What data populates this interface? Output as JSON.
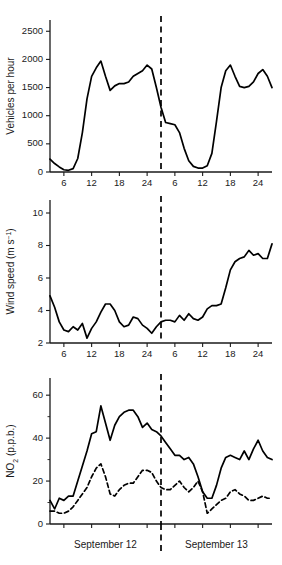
{
  "figure": {
    "day_labels": [
      "September 12",
      "September 13"
    ]
  },
  "chart_data": [
    {
      "type": "line",
      "panel": "traffic",
      "title": "",
      "xlabel": "",
      "ylabel": "Vehicles per hour",
      "ylim": [
        0,
        2700
      ],
      "yticks": [
        0,
        500,
        1000,
        1500,
        2000,
        2500
      ],
      "xlim": [
        3,
        51
      ],
      "xticks": [
        6,
        12,
        18,
        24,
        30,
        36,
        42,
        48
      ],
      "xticklabels": [
        "6",
        "12",
        "18",
        "24",
        "6",
        "12",
        "18",
        "24"
      ],
      "grid": false,
      "legend": "none",
      "annotations": [
        "dashed vertical divider at hour 27 (midnight between days)"
      ],
      "series": [
        {
          "name": "Vehicles per hour",
          "style": "solid",
          "x": [
            3,
            4,
            5,
            6,
            7,
            8,
            9,
            10,
            11,
            12,
            13,
            14,
            15,
            16,
            17,
            18,
            19,
            20,
            21,
            22,
            23,
            24,
            25,
            26,
            27,
            28,
            29,
            30,
            31,
            32,
            33,
            34,
            35,
            36,
            37,
            38,
            39,
            40,
            41,
            42,
            43,
            44,
            45,
            46,
            47,
            48,
            49,
            50,
            51
          ],
          "values": [
            230,
            150,
            90,
            40,
            30,
            60,
            240,
            700,
            1300,
            1700,
            1850,
            1970,
            1700,
            1450,
            1530,
            1570,
            1570,
            1600,
            1700,
            1750,
            1800,
            1900,
            1830,
            1500,
            1150,
            880,
            860,
            840,
            700,
            420,
            200,
            100,
            70,
            70,
            110,
            330,
            900,
            1500,
            1800,
            1900,
            1700,
            1520,
            1500,
            1520,
            1600,
            1750,
            1820,
            1700,
            1500,
            1250,
            1000,
            900,
            870,
            760
          ]
        }
      ]
    },
    {
      "type": "line",
      "panel": "wind",
      "title": "",
      "xlabel": "",
      "ylabel": "Wind speed (m s-1)",
      "ylim": [
        2,
        10.8
      ],
      "yticks": [
        2,
        4,
        6,
        8,
        10
      ],
      "xlim": [
        3,
        51
      ],
      "xticks": [
        6,
        12,
        18,
        24,
        30,
        36,
        42,
        48
      ],
      "xticklabels": [
        "6",
        "12",
        "18",
        "24",
        "6",
        "12",
        "18",
        "24"
      ],
      "grid": false,
      "legend": "none",
      "annotations": [
        "dashed vertical divider at hour 27 (midnight between days)"
      ],
      "series": [
        {
          "name": "Wind speed",
          "style": "solid",
          "x": [
            3,
            4,
            5,
            6,
            7,
            8,
            9,
            10,
            11,
            12,
            13,
            14,
            15,
            16,
            17,
            18,
            19,
            20,
            21,
            22,
            23,
            24,
            25,
            26,
            27,
            28,
            29,
            30,
            31,
            32,
            33,
            34,
            35,
            36,
            37,
            38,
            39,
            40,
            41,
            42,
            43,
            44,
            45,
            46,
            47,
            48,
            49,
            50,
            51
          ],
          "values": [
            4.9,
            4.2,
            3.3,
            2.8,
            2.7,
            3.0,
            2.8,
            3.2,
            2.3,
            2.9,
            3.3,
            3.9,
            4.4,
            4.4,
            4.0,
            3.3,
            3.0,
            3.1,
            3.6,
            3.5,
            3.1,
            2.9,
            2.6,
            3.0,
            3.3,
            3.4,
            3.4,
            3.3,
            3.7,
            3.4,
            3.8,
            3.5,
            3.4,
            3.6,
            4.1,
            4.3,
            4.3,
            4.4,
            5.4,
            6.5,
            7.0,
            7.2,
            7.3,
            7.7,
            7.4,
            7.5,
            7.2,
            7.2,
            8.1,
            7.6,
            7.8,
            7.6,
            6.6,
            5.8,
            6.3,
            6.1,
            6.0
          ]
        }
      ]
    },
    {
      "type": "line",
      "panel": "no2",
      "title": "",
      "xlabel": "",
      "ylabel": "NO2 (p.p.b.)",
      "ylim": [
        0,
        68
      ],
      "yticks": [
        0,
        20,
        40,
        60
      ],
      "minor_yticks": [
        10,
        30,
        50
      ],
      "xlim": [
        3,
        51
      ],
      "xticks": [
        6,
        12,
        18,
        24,
        30,
        36,
        42,
        48
      ],
      "grid": false,
      "legend": "none",
      "annotations": [
        "dashed vertical divider at hour 27 (midnight between days)"
      ],
      "series": [
        {
          "name": "NO2 solid trace",
          "style": "solid",
          "x": [
            3,
            4,
            5,
            6,
            7,
            8,
            9,
            10,
            11,
            12,
            13,
            14,
            15,
            16,
            17,
            18,
            19,
            20,
            21,
            22,
            23,
            24,
            25,
            26,
            27,
            28,
            29,
            30,
            31,
            32,
            33,
            34,
            35,
            36,
            37,
            38,
            39,
            40,
            41,
            42,
            43,
            44,
            45,
            46,
            47,
            48,
            49,
            50,
            51
          ],
          "values": [
            11,
            7,
            12,
            11,
            13,
            13,
            20,
            27,
            34,
            42,
            43,
            55,
            47,
            39,
            46,
            50,
            52,
            53,
            53,
            50,
            45,
            47,
            44,
            43,
            41,
            38,
            35,
            32,
            32,
            30,
            31,
            28,
            22,
            15,
            12,
            12,
            18,
            26,
            31,
            32,
            31,
            30,
            34,
            30,
            35,
            39,
            34,
            31,
            30,
            32,
            31,
            28,
            26,
            25,
            24,
            22,
            17,
            20
          ]
        },
        {
          "name": "NO2 dashed trace",
          "style": "dashed",
          "x": [
            3,
            4,
            5,
            6,
            7,
            8,
            9,
            10,
            11,
            12,
            13,
            14,
            15,
            16,
            17,
            18,
            19,
            20,
            21,
            22,
            23,
            24,
            25,
            26,
            27,
            28,
            29,
            30,
            31,
            32,
            33,
            34,
            35,
            36,
            37,
            38,
            39,
            40,
            41,
            42,
            43,
            44,
            45,
            46,
            47,
            48,
            49,
            50,
            51
          ],
          "values": [
            6,
            6,
            5,
            5,
            6,
            8,
            11,
            14,
            17,
            22,
            26,
            28,
            22,
            14,
            13,
            16,
            18,
            19,
            19,
            22,
            25,
            25,
            24,
            20,
            17,
            16,
            16,
            18,
            20,
            17,
            15,
            17,
            20,
            15,
            5,
            7,
            9,
            11,
            12,
            15,
            16,
            14,
            13,
            11,
            11,
            12,
            13,
            12,
            12,
            11,
            11,
            10,
            9,
            8,
            8,
            9,
            9
          ]
        }
      ]
    }
  ]
}
